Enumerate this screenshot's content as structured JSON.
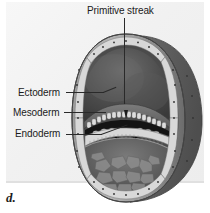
{
  "figure": {
    "letter": "d.",
    "panel_bg": "#f2f2f2"
  },
  "labels": {
    "primitive_streak": "Primitive streak",
    "ectoderm": "Ectoderm",
    "mesoderm": "Mesoderm",
    "endoderm": "Endoderm"
  },
  "diagram": {
    "colors": {
      "outer_shell": "#8f8f8f",
      "shell_shadow": "#5c5c5c",
      "amniotic_cavity": "#4a4a4a",
      "epiblast": "#6b6b6b",
      "yolk_sac_cavity": "#5f5f5f",
      "cell_layer": "#d9d9d9",
      "arrow": "#121212",
      "outline": "#3a3a3a"
    },
    "structures": [
      "trophoblast shell",
      "amniotic cavity",
      "epiblast disc",
      "primitive streak invagination",
      "mesoderm migration arrows",
      "endoderm layer",
      "yolk sac cavity"
    ]
  }
}
